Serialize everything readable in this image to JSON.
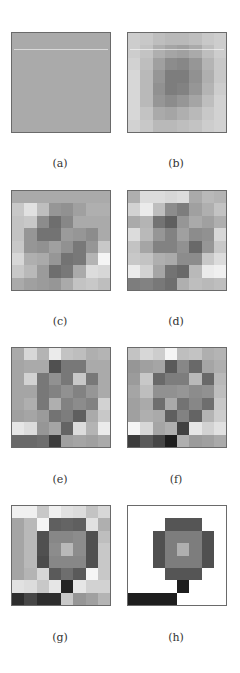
{
  "figure": {
    "panels": [
      {
        "id": "a",
        "label": "(a)",
        "x": 11,
        "y": 32,
        "grid": [
          [
            170,
            170,
            170,
            170,
            170,
            170,
            170,
            170
          ],
          [
            170,
            170,
            170,
            170,
            170,
            170,
            170,
            170
          ],
          [
            170,
            170,
            170,
            170,
            170,
            170,
            170,
            170
          ],
          [
            170,
            170,
            170,
            170,
            170,
            170,
            170,
            170
          ],
          [
            170,
            170,
            170,
            170,
            170,
            170,
            170,
            170
          ],
          [
            170,
            170,
            170,
            170,
            170,
            170,
            170,
            170
          ],
          [
            170,
            170,
            170,
            170,
            170,
            170,
            170,
            170
          ],
          [
            170,
            170,
            170,
            170,
            170,
            170,
            170,
            170
          ]
        ]
      },
      {
        "id": "b",
        "label": "(b)",
        "x": 127,
        "y": 32,
        "grid": [
          [
            205,
            200,
            190,
            185,
            185,
            190,
            200,
            205
          ],
          [
            205,
            195,
            175,
            165,
            160,
            170,
            190,
            205
          ],
          [
            210,
            190,
            160,
            140,
            135,
            150,
            180,
            200
          ],
          [
            215,
            185,
            150,
            125,
            125,
            145,
            175,
            200
          ],
          [
            215,
            185,
            145,
            125,
            130,
            150,
            180,
            205
          ],
          [
            215,
            185,
            150,
            140,
            150,
            165,
            190,
            210
          ],
          [
            215,
            195,
            170,
            165,
            175,
            185,
            200,
            210
          ],
          [
            210,
            200,
            185,
            185,
            190,
            195,
            205,
            210
          ]
        ]
      },
      {
        "id": "c",
        "label": "(c)",
        "x": 11,
        "y": 190,
        "grid": [
          [
            170,
            170,
            170,
            170,
            170,
            170,
            170,
            170
          ],
          [
            200,
            225,
            190,
            150,
            145,
            160,
            175,
            175
          ],
          [
            195,
            200,
            140,
            110,
            135,
            170,
            170,
            170
          ],
          [
            195,
            150,
            115,
            115,
            155,
            150,
            140,
            170
          ],
          [
            200,
            150,
            145,
            160,
            145,
            120,
            150,
            200
          ],
          [
            215,
            175,
            170,
            150,
            115,
            120,
            180,
            245
          ],
          [
            200,
            185,
            155,
            110,
            120,
            170,
            220,
            215
          ],
          [
            170,
            160,
            155,
            150,
            170,
            195,
            200,
            190
          ]
        ]
      },
      {
        "id": "d",
        "label": "(d)",
        "x": 127,
        "y": 190,
        "grid": [
          [
            175,
            220,
            220,
            215,
            220,
            170,
            185,
            180
          ],
          [
            210,
            235,
            190,
            140,
            125,
            160,
            175,
            195
          ],
          [
            170,
            180,
            115,
            95,
            150,
            170,
            160,
            175
          ],
          [
            220,
            185,
            150,
            130,
            160,
            140,
            145,
            215
          ],
          [
            195,
            165,
            130,
            130,
            145,
            105,
            150,
            200
          ],
          [
            200,
            195,
            175,
            170,
            140,
            140,
            200,
            220
          ],
          [
            235,
            210,
            165,
            115,
            105,
            185,
            235,
            240
          ],
          [
            125,
            130,
            120,
            110,
            175,
            190,
            185,
            190
          ]
        ]
      },
      {
        "id": "e",
        "label": "(e)",
        "x": 11,
        "y": 347,
        "grid": [
          [
            170,
            215,
            180,
            235,
            195,
            190,
            175,
            180
          ],
          [
            165,
            170,
            170,
            80,
            120,
            120,
            170,
            170
          ],
          [
            165,
            210,
            120,
            145,
            120,
            200,
            120,
            170
          ],
          [
            165,
            165,
            120,
            130,
            145,
            130,
            150,
            170
          ],
          [
            165,
            175,
            120,
            175,
            130,
            140,
            130,
            210
          ],
          [
            160,
            165,
            155,
            115,
            125,
            95,
            170,
            200
          ],
          [
            230,
            220,
            150,
            165,
            100,
            220,
            180,
            235
          ],
          [
            105,
            105,
            110,
            60,
            160,
            165,
            160,
            170
          ]
        ]
      },
      {
        "id": "f",
        "label": "(f)",
        "x": 127,
        "y": 347,
        "grid": [
          [
            195,
            215,
            205,
            245,
            190,
            195,
            175,
            180
          ],
          [
            150,
            160,
            165,
            90,
            135,
            105,
            165,
            175
          ],
          [
            155,
            200,
            105,
            125,
            125,
            185,
            105,
            185
          ],
          [
            165,
            190,
            145,
            145,
            150,
            140,
            145,
            190
          ],
          [
            160,
            170,
            110,
            170,
            115,
            135,
            110,
            200
          ],
          [
            160,
            175,
            170,
            95,
            130,
            100,
            180,
            205
          ],
          [
            245,
            215,
            165,
            175,
            65,
            230,
            210,
            225
          ],
          [
            60,
            90,
            70,
            30,
            175,
            155,
            160,
            170
          ]
        ]
      },
      {
        "id": "g",
        "label": "(g)",
        "x": 11,
        "y": 505,
        "grid": [
          [
            240,
            240,
            200,
            240,
            225,
            220,
            195,
            215
          ],
          [
            165,
            185,
            245,
            95,
            100,
            95,
            225,
            175
          ],
          [
            165,
            185,
            80,
            135,
            135,
            140,
            80,
            190
          ],
          [
            165,
            185,
            80,
            140,
            185,
            140,
            80,
            200
          ],
          [
            165,
            185,
            75,
            135,
            135,
            135,
            80,
            200
          ],
          [
            165,
            180,
            215,
            90,
            110,
            90,
            245,
            200
          ],
          [
            225,
            220,
            200,
            230,
            35,
            230,
            210,
            210
          ],
          [
            45,
            70,
            45,
            45,
            200,
            150,
            160,
            180
          ]
        ]
      },
      {
        "id": "h",
        "label": "(h)",
        "x": 127,
        "y": 505,
        "grid": [
          [
            255,
            255,
            255,
            255,
            255,
            255,
            255,
            255
          ],
          [
            255,
            255,
            255,
            85,
            85,
            85,
            255,
            255
          ],
          [
            255,
            255,
            80,
            125,
            125,
            125,
            80,
            255
          ],
          [
            255,
            255,
            80,
            125,
            175,
            125,
            80,
            255
          ],
          [
            255,
            255,
            80,
            125,
            125,
            125,
            80,
            255
          ],
          [
            255,
            255,
            255,
            85,
            85,
            85,
            255,
            255
          ],
          [
            255,
            255,
            255,
            255,
            30,
            255,
            255,
            255
          ],
          [
            30,
            30,
            30,
            30,
            255,
            255,
            255,
            255
          ]
        ]
      }
    ],
    "labels": [
      {
        "text": "(a)",
        "x": 40,
        "y": 157
      },
      {
        "text": "(b)",
        "x": 156,
        "y": 157
      },
      {
        "text": "(c)",
        "x": 40,
        "y": 315
      },
      {
        "text": "(d)",
        "x": 156,
        "y": 315
      },
      {
        "text": "(e)",
        "x": 40,
        "y": 473
      },
      {
        "text": "(f)",
        "x": 156,
        "y": 473
      },
      {
        "text": "(g)",
        "x": 40,
        "y": 631
      },
      {
        "text": "(h)",
        "x": 156,
        "y": 631
      }
    ]
  }
}
